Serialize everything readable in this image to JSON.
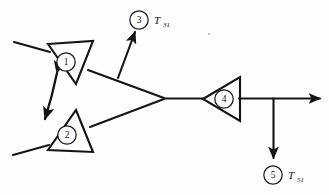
{
  "diagram": {
    "type": "signal-flow-block-diagram",
    "background_color": "#fefefe",
    "line_color": "#141414",
    "nodes": [
      {
        "id": "1",
        "label": "1",
        "shape": "triangle",
        "cx": 66,
        "cy": 62
      },
      {
        "id": "2",
        "label": "2",
        "shape": "triangle",
        "cx": 67,
        "cy": 135
      },
      {
        "id": "3",
        "label": "3",
        "shape": "circle",
        "cx": 139,
        "cy": 20
      },
      {
        "id": "4",
        "label": "4",
        "shape": "triangle",
        "cx": 224,
        "cy": 99
      },
      {
        "id": "5",
        "label": "5",
        "shape": "circle",
        "cx": 273,
        "cy": 175
      }
    ],
    "labels": [
      {
        "id": "T31",
        "base": "T",
        "subscript": "31",
        "x": 154,
        "y": 22
      },
      {
        "id": "T51",
        "base": "T",
        "subscript": "51",
        "x": 288,
        "y": 177
      }
    ],
    "arrows": [
      {
        "id": "bidirectional-1-2",
        "from": "1",
        "to": "2",
        "heads": "both"
      },
      {
        "id": "branch-to-3",
        "from": "link-1-junction",
        "to": "3",
        "heads": "end"
      },
      {
        "id": "output-right",
        "from": "junction-right",
        "to": "right-edge",
        "heads": "end"
      },
      {
        "id": "branch-to-5",
        "from": "junction-right",
        "to": "5",
        "heads": "end"
      }
    ]
  }
}
